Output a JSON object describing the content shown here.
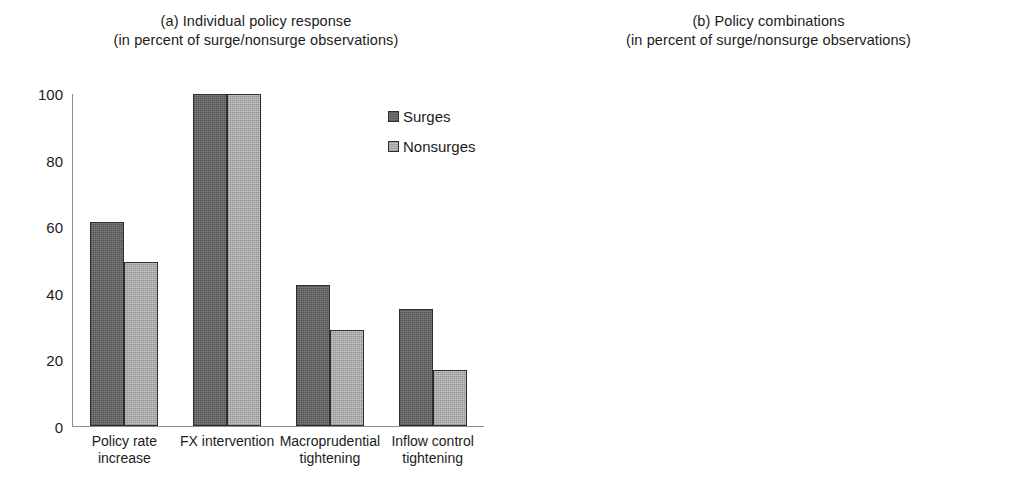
{
  "chart_data": [
    {
      "id": "panel-a",
      "type": "bar",
      "title": "(a) Individual policy response",
      "subtitle": "(in percent of surge/nonsurge observations)",
      "xlabel": "",
      "ylabel": "",
      "ylim": [
        0,
        100
      ],
      "yticks": [
        0,
        20,
        40,
        60,
        80,
        100
      ],
      "ytick_labels": [
        "0",
        "20",
        "40",
        "60",
        "80",
        "100"
      ],
      "grid": false,
      "legend_position": "right",
      "categories": [
        "Policy rate increase",
        "FX intervention",
        "Macroprudential tightening",
        "Inflow control tightening"
      ],
      "category_lines": [
        [
          "Policy rate",
          "increase"
        ],
        [
          "FX intervention",
          ""
        ],
        [
          "Macroprudential",
          "tightening"
        ],
        [
          "Inflow control",
          "tightening"
        ]
      ],
      "series": [
        {
          "name": "Surges",
          "color": "#6a6a6a",
          "values": [
            61.5,
            100,
            42.5,
            35.2
          ]
        },
        {
          "name": "Nonsurges",
          "color": "#b2b2b2",
          "values": [
            49.5,
            100,
            29.0,
            17.0
          ]
        }
      ]
    },
    {
      "id": "panel-b",
      "type": "bar",
      "title": "(b) Policy combinations",
      "subtitle": "(in percent of surge/nonsurge observations)",
      "xlabel": "",
      "ylabel": "",
      "ylim": [
        0,
        50
      ],
      "yticks": [
        0,
        10,
        20,
        30,
        40,
        50
      ],
      "ytick_labels": [
        "0",
        "10",
        "20",
        "30",
        "40",
        "50"
      ],
      "grid": false,
      "legend_position": "right",
      "categories": [
        "1 instrument",
        "2 instruments",
        "3 or more instruments"
      ],
      "category_lines": [
        [
          "1 instrument",
          ""
        ],
        [
          "2 instruments",
          ""
        ],
        [
          "3 or more instruments",
          ""
        ]
      ],
      "series": [
        {
          "name": "Surges",
          "color": "#6a6a6a",
          "values": [
            23.0,
            50.2,
            27.2
          ]
        },
        {
          "name": "Nonsurges",
          "color": "#b2b2b2",
          "values": [
            33.0,
            44.0,
            23.5
          ]
        }
      ]
    }
  ],
  "colors": {
    "surges": "#6a6a6a",
    "nonsurges": "#b2b2b2",
    "axis": "#8c8c8c",
    "bar_border": "#2e2e2e",
    "text": "#1c1c1c",
    "background": "#ffffff"
  }
}
